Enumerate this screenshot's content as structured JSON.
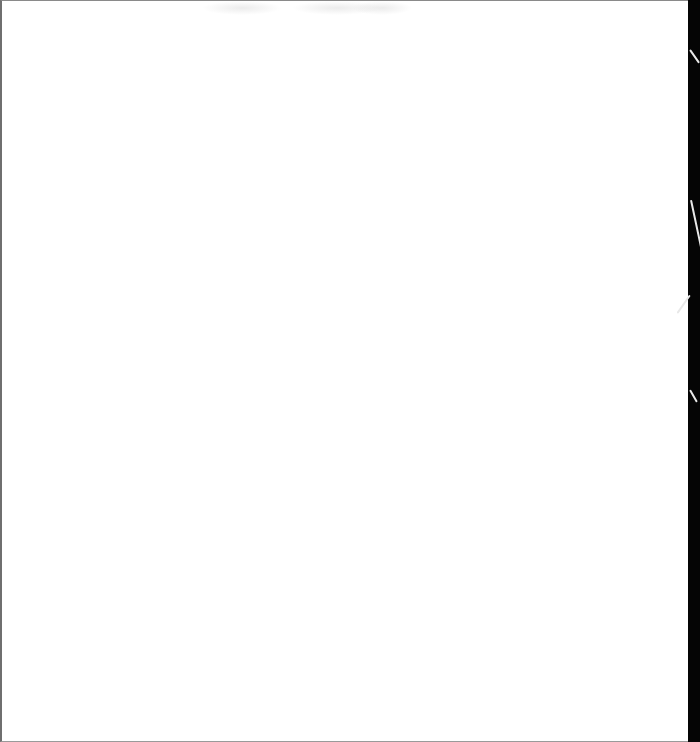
{
  "document": {
    "type": "scanned-page",
    "content": "",
    "page_color": "#ffffff",
    "edge_color": "#050505"
  }
}
